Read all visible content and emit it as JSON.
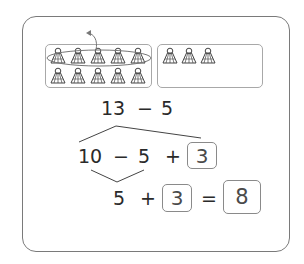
{
  "illustration": {
    "ten_frame_count": 10,
    "extra_count": 3,
    "crossed_out_count": 5,
    "item_icon": "shuttlecock-icon"
  },
  "problem": {
    "expression": {
      "left": "13",
      "op": "−",
      "right": "5"
    }
  },
  "step1": {
    "a": "10",
    "op1": "−",
    "b": "5",
    "op2": "+",
    "c": "3"
  },
  "step2": {
    "a": "5",
    "op1": "+",
    "b": "3",
    "eq": "=",
    "result": "8"
  },
  "colors": {
    "border": "#7a7a7a",
    "box_border": "#a8a8a8",
    "text": "#2a2a2a"
  }
}
